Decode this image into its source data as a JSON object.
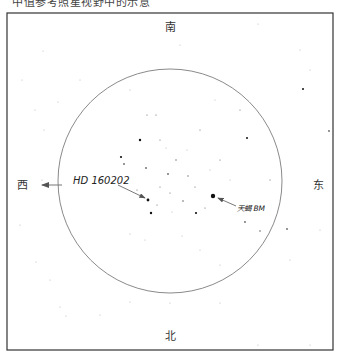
{
  "caption": "中值参考照星视野中的示意",
  "frame": {
    "x": 7,
    "y": 13,
    "width": 326,
    "height": 337,
    "border_color": "#333333"
  },
  "field_circle": {
    "cx": 170,
    "cy": 181,
    "r": 112,
    "stroke": "#8a8a8a"
  },
  "directions": {
    "south": "南",
    "north": "北",
    "west": "西",
    "east": "东"
  },
  "labels": {
    "reference_star": "HD 160202",
    "target_star": "天蝎 BM"
  },
  "stars": [
    {
      "x": 148,
      "y": 200,
      "r": 1.4
    },
    {
      "x": 213,
      "y": 196,
      "r": 2.2
    },
    {
      "x": 140,
      "y": 140,
      "r": 1.2
    },
    {
      "x": 121,
      "y": 157,
      "r": 1.1
    },
    {
      "x": 124,
      "y": 164,
      "r": 0.9
    },
    {
      "x": 146,
      "y": 168,
      "r": 0.9
    },
    {
      "x": 168,
      "y": 174,
      "r": 0.9
    },
    {
      "x": 151,
      "y": 213,
      "r": 1.2
    },
    {
      "x": 196,
      "y": 213,
      "r": 1.1
    },
    {
      "x": 183,
      "y": 201,
      "r": 0.8
    },
    {
      "x": 247,
      "y": 138,
      "r": 1.0
    },
    {
      "x": 303,
      "y": 89,
      "r": 1.0
    },
    {
      "x": 329,
      "y": 131,
      "r": 0.9
    },
    {
      "x": 245,
      "y": 222,
      "r": 0.9
    },
    {
      "x": 260,
      "y": 231,
      "r": 0.8
    },
    {
      "x": 287,
      "y": 229,
      "r": 0.9
    },
    {
      "x": 188,
      "y": 176,
      "r": 0.7
    },
    {
      "x": 176,
      "y": 160,
      "r": 0.7
    },
    {
      "x": 160,
      "y": 140,
      "r": 0.6
    },
    {
      "x": 156,
      "y": 115,
      "r": 0.6
    },
    {
      "x": 147,
      "y": 115,
      "r": 0.6
    },
    {
      "x": 160,
      "y": 187,
      "r": 0.6
    },
    {
      "x": 195,
      "y": 187,
      "r": 0.6
    },
    {
      "x": 170,
      "y": 193,
      "r": 0.6
    },
    {
      "x": 205,
      "y": 208,
      "r": 0.6
    },
    {
      "x": 157,
      "y": 205,
      "r": 0.6
    },
    {
      "x": 137,
      "y": 190,
      "r": 0.6
    },
    {
      "x": 220,
      "y": 160,
      "r": 0.6
    },
    {
      "x": 200,
      "y": 130,
      "r": 0.6
    },
    {
      "x": 240,
      "y": 110,
      "r": 0.6
    },
    {
      "x": 270,
      "y": 180,
      "r": 0.6
    },
    {
      "x": 166,
      "y": 148,
      "r": 0.5
    },
    {
      "x": 187,
      "y": 150,
      "r": 0.5
    },
    {
      "x": 210,
      "y": 170,
      "r": 0.5
    },
    {
      "x": 230,
      "y": 180,
      "r": 0.5
    },
    {
      "x": 172,
      "y": 212,
      "r": 0.5
    },
    {
      "x": 182,
      "y": 236,
      "r": 0.5
    },
    {
      "x": 130,
      "y": 234,
      "r": 0.5
    },
    {
      "x": 145,
      "y": 240,
      "r": 0.5
    },
    {
      "x": 200,
      "y": 250,
      "r": 0.5
    },
    {
      "x": 220,
      "y": 265,
      "r": 0.5
    },
    {
      "x": 44,
      "y": 130,
      "r": 0.5
    },
    {
      "x": 42,
      "y": 180,
      "r": 0.5
    },
    {
      "x": 22,
      "y": 80,
      "r": 0.5
    },
    {
      "x": 43,
      "y": 51,
      "r": 0.5
    },
    {
      "x": 58,
      "y": 102,
      "r": 0.5
    },
    {
      "x": 35,
      "y": 110,
      "r": 0.5
    },
    {
      "x": 20,
      "y": 225,
      "r": 0.5
    },
    {
      "x": 36,
      "y": 262,
      "r": 0.5
    },
    {
      "x": 50,
      "y": 280,
      "r": 0.5
    },
    {
      "x": 60,
      "y": 307,
      "r": 0.5
    },
    {
      "x": 66,
      "y": 316,
      "r": 0.5
    },
    {
      "x": 100,
      "y": 315,
      "r": 0.5
    },
    {
      "x": 130,
      "y": 302,
      "r": 0.5
    },
    {
      "x": 170,
      "y": 303,
      "r": 0.5
    },
    {
      "x": 220,
      "y": 303,
      "r": 0.5
    },
    {
      "x": 258,
      "y": 345,
      "r": 0.5
    },
    {
      "x": 310,
      "y": 345,
      "r": 0.5
    },
    {
      "x": 290,
      "y": 260,
      "r": 0.5
    },
    {
      "x": 300,
      "y": 50,
      "r": 0.5
    },
    {
      "x": 310,
      "y": 70,
      "r": 0.5
    },
    {
      "x": 320,
      "y": 230,
      "r": 0.5
    },
    {
      "x": 258,
      "y": 24,
      "r": 0.5
    },
    {
      "x": 80,
      "y": 80,
      "r": 0.5
    },
    {
      "x": 130,
      "y": 90,
      "r": 0.5
    },
    {
      "x": 215,
      "y": 100,
      "r": 0.5
    },
    {
      "x": 180,
      "y": 45,
      "r": 0.5
    }
  ]
}
